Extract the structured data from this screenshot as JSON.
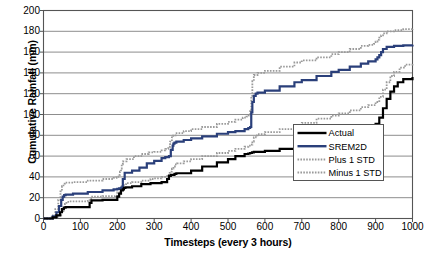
{
  "chart_data": {
    "type": "line",
    "title": "",
    "xlabel": "Timesteps (every 3 hours)",
    "ylabel": "Cumulative Rainfall (mm)",
    "xlim": [
      0,
      1000
    ],
    "ylim": [
      0,
      200
    ],
    "xticks": [
      0,
      100,
      200,
      300,
      400,
      500,
      600,
      700,
      800,
      900,
      1000
    ],
    "yticks": [
      0,
      20,
      40,
      60,
      80,
      100,
      120,
      140,
      160,
      180,
      200
    ],
    "grid": "horizontal",
    "legend_position": "center-right",
    "series": [
      {
        "name": "Actual",
        "color": "#000000",
        "style": "solid",
        "width": 2.2,
        "x": [
          0,
          25,
          35,
          45,
          50,
          55,
          60,
          70,
          120,
          125,
          130,
          160,
          195,
          200,
          205,
          210,
          215,
          218,
          222,
          240,
          265,
          290,
          300,
          320,
          335,
          340,
          345,
          350,
          355,
          360,
          400,
          430,
          470,
          500,
          520,
          545,
          555,
          560,
          565,
          570,
          575,
          580,
          600,
          640,
          680,
          700,
          740,
          780,
          800,
          830,
          860,
          880,
          900,
          910,
          920,
          930,
          940,
          950,
          960,
          975,
          1000
        ],
        "y": [
          0,
          1,
          3,
          6,
          9,
          10.5,
          11,
          11,
          11,
          15,
          17.5,
          18,
          18,
          21,
          24,
          27,
          28,
          29.5,
          30,
          31,
          33,
          34,
          34,
          35,
          38,
          41,
          42,
          42,
          43,
          43.5,
          46,
          50,
          54,
          57,
          60,
          62,
          62.5,
          63,
          63.5,
          64,
          64,
          64,
          65,
          67,
          71,
          73,
          77,
          80,
          82,
          85,
          87,
          89,
          91,
          97,
          106,
          115,
          122,
          127,
          131,
          134,
          136
        ]
      },
      {
        "name": "SREM2D",
        "color": "#2a3f7a",
        "style": "solid",
        "width": 2.2,
        "x": [
          0,
          25,
          35,
          42,
          48,
          52,
          56,
          60,
          80,
          120,
          160,
          190,
          200,
          205,
          210,
          212,
          215,
          220,
          240,
          260,
          280,
          300,
          320,
          330,
          340,
          345,
          350,
          352,
          355,
          360,
          380,
          400,
          430,
          470,
          500,
          520,
          545,
          555,
          560,
          563,
          566,
          570,
          575,
          580,
          600,
          640,
          680,
          700,
          740,
          780,
          800,
          830,
          860,
          880,
          900,
          905,
          910,
          915,
          920,
          930,
          950,
          975,
          1000
        ],
        "y": [
          0,
          2,
          6,
          12,
          18,
          21,
          22.5,
          23,
          24,
          25.5,
          27,
          28,
          28.5,
          29,
          29.5,
          30,
          38,
          44,
          46,
          49,
          53,
          55.5,
          58,
          59,
          60,
          66,
          70,
          72,
          73,
          74,
          75.5,
          77,
          79,
          81.5,
          83,
          84,
          86,
          87,
          88,
          102,
          112,
          118,
          120,
          121,
          123,
          127,
          131,
          133,
          137,
          141,
          143,
          146,
          149,
          151,
          153,
          155,
          157,
          160,
          163,
          165,
          166,
          166.5,
          167
        ]
      },
      {
        "name": "Plus 1 STD",
        "color": "#9a9a9a",
        "style": "dotted",
        "width": 1.8,
        "x": [
          0,
          22,
          32,
          40,
          46,
          50,
          54,
          58,
          80,
          120,
          160,
          190,
          198,
          203,
          207,
          210,
          212,
          215,
          225,
          245,
          265,
          285,
          300,
          320,
          330,
          338,
          343,
          348,
          352,
          358,
          380,
          400,
          430,
          470,
          500,
          520,
          540,
          550,
          556,
          560,
          563,
          566,
          570,
          580,
          600,
          640,
          680,
          700,
          740,
          780,
          800,
          830,
          860,
          880,
          895,
          900,
          905,
          910,
          915,
          920,
          930,
          950,
          975,
          1000
        ],
        "y": [
          0,
          3,
          9,
          18,
          26,
          31,
          33.5,
          34.5,
          35,
          36.5,
          38,
          39,
          40,
          42,
          45,
          48,
          52,
          55,
          57,
          60,
          62,
          63.5,
          64,
          65.5,
          67,
          69,
          74,
          78,
          80,
          82,
          84,
          86,
          88,
          91,
          93,
          95,
          97,
          98,
          99,
          104,
          118,
          132,
          138,
          140,
          142,
          146,
          150,
          152,
          155,
          158,
          160,
          163,
          166,
          167,
          168,
          170,
          172,
          174,
          176,
          178,
          180,
          181,
          182,
          183
        ]
      },
      {
        "name": "Minus 1 STD",
        "color": "#9a9a9a",
        "style": "dotted",
        "width": 1.8,
        "x": [
          0,
          28,
          38,
          48,
          54,
          58,
          62,
          70,
          120,
          125,
          132,
          160,
          195,
          200,
          206,
          212,
          218,
          224,
          240,
          265,
          290,
          300,
          320,
          335,
          342,
          348,
          352,
          356,
          362,
          380,
          400,
          430,
          470,
          500,
          520,
          545,
          555,
          562,
          566,
          570,
          575,
          580,
          600,
          640,
          680,
          700,
          740,
          780,
          800,
          830,
          860,
          880,
          900,
          910,
          920,
          930,
          940,
          950,
          965,
          980,
          1000
        ],
        "y": [
          0,
          1,
          3,
          7,
          11,
          14,
          16,
          16.5,
          17,
          19,
          21,
          21.5,
          22,
          25,
          28,
          31,
          33,
          34,
          35,
          36.5,
          38,
          38.5,
          40,
          42,
          45,
          48,
          50,
          52,
          53,
          55,
          57,
          60,
          63,
          65,
          67,
          69,
          70,
          71,
          74,
          78,
          80,
          81,
          83,
          86,
          90,
          92,
          96,
          99,
          101,
          104,
          107,
          109,
          112,
          117,
          124,
          131,
          137,
          141,
          145,
          148,
          150
        ]
      }
    ]
  },
  "legend": {
    "items": [
      {
        "label": "Actual"
      },
      {
        "label": "SREM2D"
      },
      {
        "label": "Plus 1 STD"
      },
      {
        "label": "Minus 1 STD"
      }
    ]
  }
}
